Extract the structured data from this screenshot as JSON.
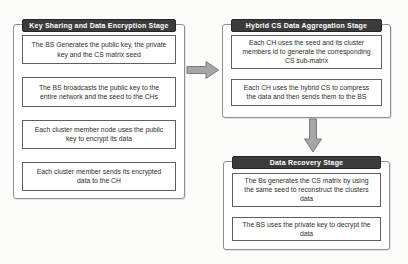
{
  "diagram": {
    "stages": [
      {
        "id": "key-sharing",
        "title": "Key Sharing and Data Encryption Stage",
        "steps": [
          "The BS Generates the public key, the private key and the CS matrix seed",
          "The BS broadcasts the public key to the entire network and the seed to the CHs",
          "Each cluster member node uses the public key to encrypt its data",
          "Each cluster member sends its encrypted data to the CH"
        ]
      },
      {
        "id": "aggregation",
        "title": "Hybrid CS Data Aggregation Stage",
        "steps": [
          "Each CH uses the seed and its cluster members id to generate the corresponding CS sub-matrix",
          "Each CH uses the hybrid CS to compress the data and then sends them to the BS"
        ]
      },
      {
        "id": "recovery",
        "title": "Data Recovery Stage",
        "steps": [
          "The Bs generates the CS matrix by using the same seed to reconstruct the clusters data",
          "The BS uses the private key to decrypt the data"
        ]
      }
    ],
    "connectors": [
      {
        "from": "key-sharing",
        "to": "aggregation",
        "direction": "right"
      },
      {
        "from": "aggregation",
        "to": "recovery",
        "direction": "down"
      }
    ],
    "colors": {
      "header_bg": "#3b3b3b",
      "header_text": "#ffffff",
      "stage_border": "#8f8f8f",
      "step_border": "#5f5f5f",
      "arrow_fill": "#a6a6a6",
      "arrow_stroke": "#7b7b7b",
      "background": "#fcfcfb"
    }
  }
}
